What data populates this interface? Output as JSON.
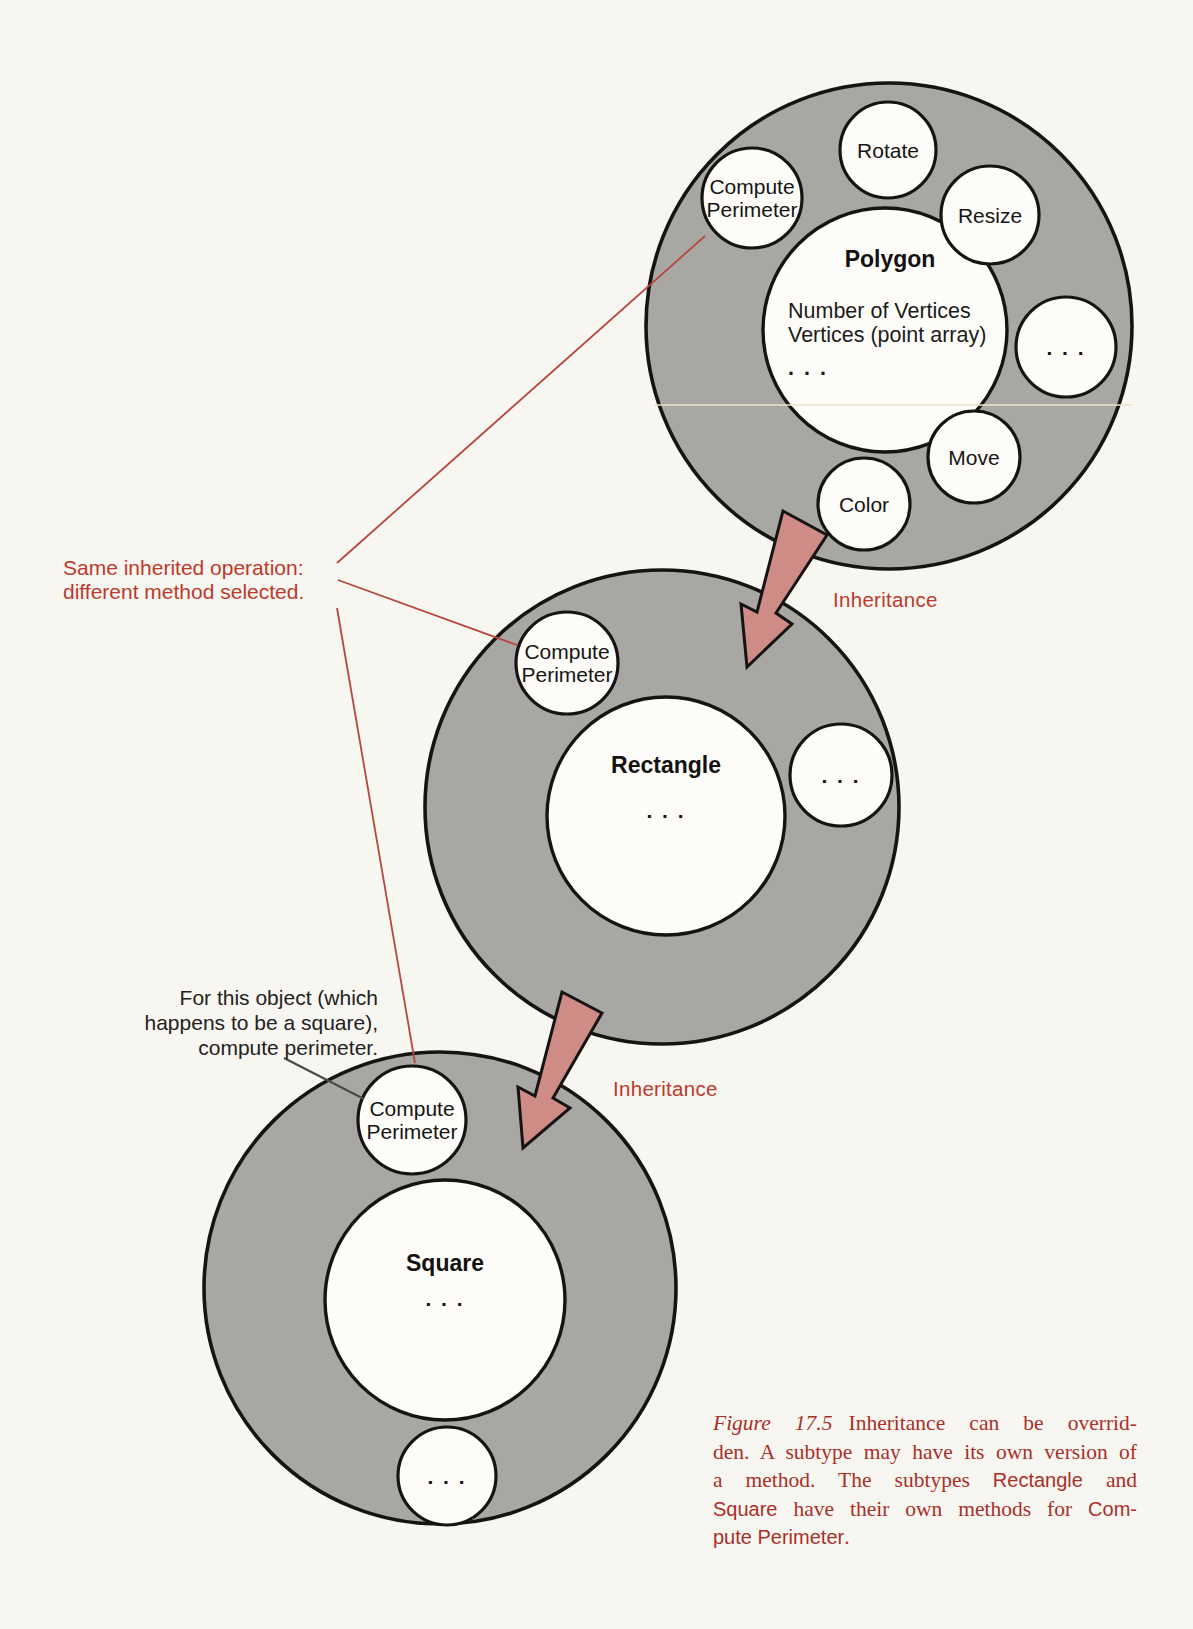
{
  "colors": {
    "paper": "#f8f6f0",
    "object_gray": "#a9a7a4",
    "circle_white": "#fdfcf9",
    "outline_black": "#151413",
    "arrow_fill": "#cf8b86",
    "red_accent": "#bd392c",
    "caption_red": "#a93028",
    "pointer_line_red": "#b5473c",
    "pointer_line_black": "#4a4a48"
  },
  "polygon": {
    "title": "Polygon",
    "attributes": "Number of Vertices\nVertices (point array)",
    "ellipsis": ". . .",
    "methods": {
      "compute_perimeter": "Compute Perimeter",
      "rotate": "Rotate",
      "resize": "Resize",
      "more": ". . .",
      "move": "Move",
      "color": "Color"
    }
  },
  "rectangle": {
    "title": "Rectangle",
    "ellipsis": ". . .",
    "methods": {
      "compute_perimeter": "Compute Perimeter",
      "more": ". . ."
    }
  },
  "square": {
    "title": "Square",
    "ellipsis": ". . .",
    "methods": {
      "compute_perimeter": "Compute Perimeter",
      "more": ". . ."
    }
  },
  "annotations": {
    "same_inherited": "Same inherited operation:\ndifferent method selected.",
    "for_this_object": "For this object (which\nhappens to be a square),\ncompute perimeter.",
    "inheritance_top": "Inheritance",
    "inheritance_bottom": "Inheritance"
  },
  "caption": {
    "figure_label": "Figure 17.5",
    "line1": "Inheritance can be overrid-",
    "line2": "den. A subtype may have its own version of",
    "line3_a": "a method. The subtypes ",
    "line3_b": "Rectangle",
    "line3_c": " and",
    "line4_a": "Square",
    "line4_b": " have their own methods for ",
    "line4_c": "Com-",
    "line5_a": "pute Perimeter",
    "line5_b": "."
  }
}
